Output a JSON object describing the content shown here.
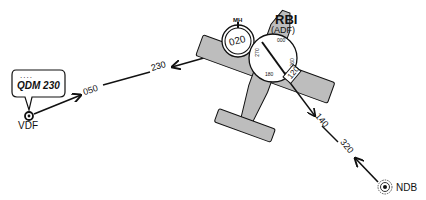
{
  "vdf": {
    "label": "VDF",
    "callout": {
      "dots": "....",
      "text": "QDM 230"
    },
    "bearing_out": "050",
    "bearing_in": "230"
  },
  "aircraft": {
    "mh_label": "MH",
    "heading": "020",
    "rbi_title": "RBI",
    "rbi_subtitle": "(ADF)",
    "rbi_pointer_value": "120",
    "rbi_ticks": [
      "000",
      "090",
      "180",
      "270"
    ]
  },
  "ndb": {
    "label": "NDB",
    "bearing_out": "320",
    "bearing_in": "140"
  },
  "colors": {
    "line": "#111111",
    "fill_gray": "#bdbdbd",
    "background": "#ffffff"
  }
}
